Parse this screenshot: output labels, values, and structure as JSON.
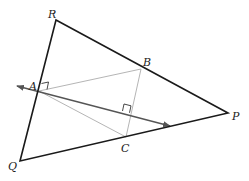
{
  "diagram": {
    "type": "geometry",
    "colors": {
      "triangle": "#1a1a1a",
      "inner": "#b5b5b5",
      "line": "#555555",
      "marker": "#333333"
    },
    "points": {
      "R": {
        "label": "R",
        "x": 56,
        "y": 20
      },
      "P": {
        "label": "P",
        "x": 228,
        "y": 113
      },
      "Q": {
        "label": "Q",
        "x": 20,
        "y": 161
      },
      "A": {
        "label": "A",
        "x": 39,
        "y": 91
      },
      "B": {
        "label": "B",
        "x": 141,
        "y": 69
      },
      "C": {
        "label": "C",
        "x": 126,
        "y": 137
      }
    },
    "labels": {
      "R": "R",
      "P": "P",
      "Q": "Q",
      "A": "A",
      "B": "B",
      "C": "C"
    },
    "outer_triangle": [
      "R",
      "P",
      "Q"
    ],
    "inner_triangle": [
      "A",
      "B",
      "C"
    ],
    "double_arrow_line": {
      "from": [
        17,
        86
      ],
      "to": [
        170,
        126
      ],
      "through": "A"
    },
    "right_angles": [
      {
        "at": "A",
        "between": [
          "RQ",
          "AB"
        ]
      },
      {
        "at": "foot-from-B",
        "between": [
          "arrow-line",
          "BC"
        ]
      }
    ]
  }
}
